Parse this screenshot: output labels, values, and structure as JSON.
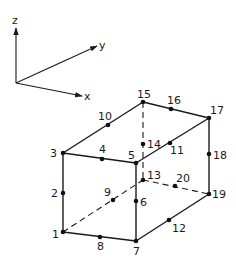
{
  "diagram": {
    "axes": {
      "origin": [
        16,
        83
      ],
      "x": {
        "label": "x",
        "tip": [
          82,
          96
        ]
      },
      "y": {
        "label": "y",
        "tip": [
          97,
          46
        ]
      },
      "z": {
        "label": "z",
        "tip": [
          16,
          28
        ]
      }
    },
    "nodes": [
      {
        "id": "1",
        "x": 63,
        "y": 232,
        "lx": 52,
        "ly": 238
      },
      {
        "id": "2",
        "x": 63,
        "y": 193,
        "lx": 51,
        "ly": 197
      },
      {
        "id": "3",
        "x": 63,
        "y": 153,
        "lx": 50,
        "ly": 157
      },
      {
        "id": "4",
        "x": 102,
        "y": 159,
        "lx": 99,
        "ly": 153
      },
      {
        "id": "5",
        "x": 136,
        "y": 163,
        "lx": 128,
        "ly": 159
      },
      {
        "id": "6",
        "x": 136,
        "y": 201,
        "lx": 140,
        "ly": 206
      },
      {
        "id": "7",
        "x": 136,
        "y": 241,
        "lx": 133,
        "ly": 255
      },
      {
        "id": "8",
        "x": 100,
        "y": 237,
        "lx": 97,
        "ly": 250
      },
      {
        "id": "9",
        "x": 113,
        "y": 200,
        "lx": 104,
        "ly": 196
      },
      {
        "id": "10",
        "x": 108,
        "y": 125,
        "lx": 98,
        "ly": 120
      },
      {
        "id": "11",
        "x": 170,
        "y": 143,
        "lx": 170,
        "ly": 154
      },
      {
        "id": "12",
        "x": 169,
        "y": 220,
        "lx": 172,
        "ly": 232
      },
      {
        "id": "13",
        "x": 143,
        "y": 180,
        "lx": 147,
        "ly": 179
      },
      {
        "id": "14",
        "x": 143,
        "y": 144,
        "lx": 147,
        "ly": 148
      },
      {
        "id": "15",
        "x": 143,
        "y": 102,
        "lx": 137,
        "ly": 98
      },
      {
        "id": "16",
        "x": 171,
        "y": 109,
        "lx": 167,
        "ly": 104
      },
      {
        "id": "17",
        "x": 209,
        "y": 118,
        "lx": 210,
        "ly": 114
      },
      {
        "id": "18",
        "x": 209,
        "y": 154,
        "lx": 213,
        "ly": 159
      },
      {
        "id": "19",
        "x": 209,
        "y": 194,
        "lx": 212,
        "ly": 198
      },
      {
        "id": "20",
        "x": 175,
        "y": 186,
        "lx": 176,
        "ly": 182
      }
    ],
    "visible_edges": [
      [
        "3",
        "5"
      ],
      [
        "3",
        "15"
      ],
      [
        "15",
        "17"
      ],
      [
        "5",
        "17"
      ],
      [
        "3",
        "1"
      ],
      [
        "5",
        "7"
      ],
      [
        "17",
        "19"
      ],
      [
        "1",
        "7"
      ],
      [
        "7",
        "19"
      ]
    ],
    "hidden_edges": [
      [
        "15",
        "13"
      ],
      [
        "1",
        "13"
      ],
      [
        "13",
        "19"
      ]
    ],
    "colors": {
      "ink": "#1a1a1a",
      "background": "#ffffff"
    }
  }
}
